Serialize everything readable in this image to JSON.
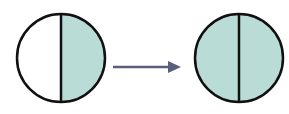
{
  "diagram": {
    "colors": {
      "fill": "#b9dcd6",
      "stroke": "#111111",
      "arrow": "#5a5f7e",
      "background": "#ffffff"
    },
    "left_circle": {
      "shaded_fraction": "1/2",
      "shaded_side": "right"
    },
    "arrow": {
      "direction": "right"
    },
    "right_circle": {
      "shaded_fraction": "2/2",
      "shaded_side": "both"
    }
  }
}
